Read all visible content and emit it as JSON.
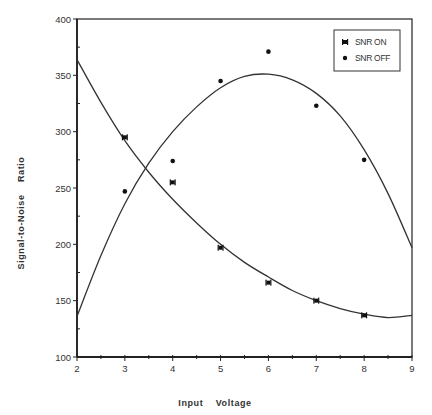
{
  "chart_data": {
    "type": "scatter",
    "title": "",
    "xlabel": "Input    Voltage",
    "ylabel": "Signal-to-Noise    Ratio",
    "xlim": [
      2,
      9
    ],
    "ylim": [
      100,
      400
    ],
    "x_ticks": [
      2,
      3,
      4,
      5,
      6,
      7,
      8,
      9
    ],
    "y_ticks": [
      100,
      150,
      200,
      250,
      300,
      350,
      400
    ],
    "x_minor_step": 0.5,
    "y_minor_step": 25,
    "grid": false,
    "legend_position": "upper right",
    "series": [
      {
        "name": "SNR ON",
        "marker": "bowtie-square",
        "x": [
          3,
          4,
          5,
          6,
          7,
          8
        ],
        "values": [
          295,
          255,
          197,
          166,
          150,
          137
        ],
        "fit_curve": {
          "type": "polynomial",
          "x": [
            2,
            2.5,
            3,
            3.5,
            4,
            4.5,
            5,
            5.5,
            6,
            6.5,
            7,
            7.5,
            8,
            8.5,
            9
          ],
          "y": [
            364,
            326,
            292,
            264,
            240,
            219,
            200,
            184,
            171,
            159,
            150,
            143,
            138,
            135,
            137
          ]
        }
      },
      {
        "name": "SNR OFF",
        "marker": "dot",
        "x": [
          3,
          4,
          5,
          6,
          7,
          8
        ],
        "values": [
          247,
          274,
          345,
          371,
          323,
          275
        ],
        "fit_curve": {
          "type": "polynomial",
          "x": [
            2,
            2.5,
            3,
            3.5,
            4,
            4.5,
            5,
            5.5,
            6,
            6.5,
            7,
            7.5,
            8,
            8.5,
            9
          ],
          "y": [
            136,
            190,
            236,
            272,
            300,
            322,
            339,
            349,
            351,
            346,
            334,
            314,
            284,
            245,
            197
          ]
        }
      }
    ]
  },
  "legend": {
    "items": [
      {
        "label": "SNR ON"
      },
      {
        "label": "SNR OFF"
      }
    ]
  },
  "colors": {
    "axis": "#222222",
    "curve": "#333333",
    "marker": "#111111"
  }
}
